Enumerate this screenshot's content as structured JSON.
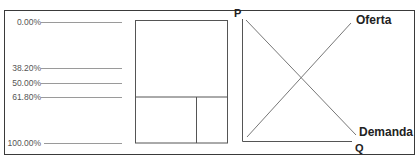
{
  "fibonacci_levels": [
    {
      "label": "0.00%",
      "value": 0.0
    },
    {
      "label": "38.20%",
      "value": 38.2
    },
    {
      "label": "50.00%",
      "value": 50.0
    },
    {
      "label": "61.80%",
      "value": 61.8
    },
    {
      "label": "100.00%",
      "value": 100.0
    }
  ],
  "supply_demand": {
    "y_axis_label": "P",
    "x_axis_label": "Q",
    "supply_label": "Oferta",
    "demand_label": "Demanda"
  },
  "colors": {
    "line": "#9a9a9a",
    "box": "#555555",
    "text": "#222222"
  }
}
